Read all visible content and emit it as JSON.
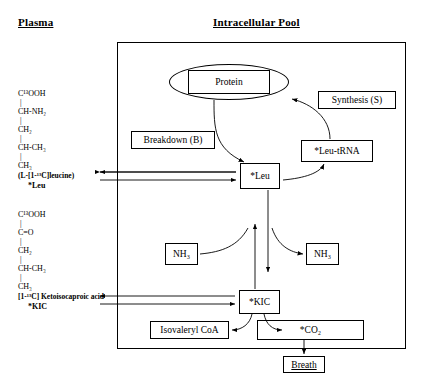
{
  "headings": {
    "left": "Plasma",
    "right": "Intracellular Pool"
  },
  "plasma": {
    "leucine_structure": {
      "lines": [
        "C¹³OOH",
        "CH-NH₂",
        "CH₂",
        "CH-CH₃",
        "CH₃"
      ],
      "name": "(L-[1-¹³C]leucine)",
      "tracer": "*Leu"
    },
    "kic_structure": {
      "lines": [
        "C¹³OOH",
        "C=O",
        "CH₂",
        "CH-CH₃",
        "CH₃"
      ],
      "name": "[1-¹³C] Ketoisocaproic acid",
      "tracer": "*KIC"
    }
  },
  "intracellular": {
    "protein": "Protein",
    "synthesis": "Synthesis (S)",
    "breakdown": "Breakdown (B)",
    "leu": "*Leu",
    "leu_trna": "*Leu-tRNA",
    "nh3_in": "NH₃",
    "nh3_out": "NH₃",
    "kic": "*KIC",
    "isovaleryl_coa": "Isovaleryl CoA",
    "co2": "*CO₂"
  },
  "breath": "Breath",
  "colors": {
    "stroke": "#000000",
    "background": "#ffffff"
  }
}
